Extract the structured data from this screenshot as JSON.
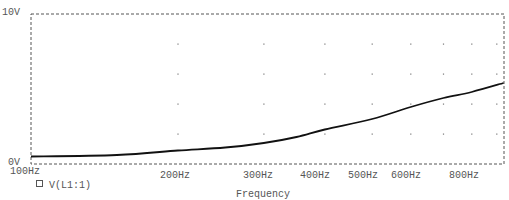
{
  "chart_data": {
    "type": "line",
    "title": "",
    "xlabel": "Frequency",
    "ylabel": "",
    "x_scale": "log",
    "xlim": [
      100,
      930
    ],
    "ylim": [
      0,
      10
    ],
    "y_tick_labels": [
      "0V",
      "10V"
    ],
    "x_tick_labels": [
      "100Hz",
      "200Hz",
      "300Hz",
      "400Hz",
      "500Hz",
      "600Hz",
      "800Hz"
    ],
    "grid": "dotted points at 2V steps and 100Hz decade steps",
    "legend": [
      {
        "marker": "square",
        "label": "V(L1:1)"
      }
    ],
    "series": [
      {
        "name": "V(L1:1)",
        "x": [
          100,
          150,
          200,
          250,
          300,
          350,
          400,
          500,
          600,
          700,
          800,
          930
        ],
        "y": [
          0.5,
          0.6,
          0.9,
          1.1,
          1.4,
          1.8,
          2.3,
          3.0,
          3.8,
          4.4,
          4.8,
          5.4
        ]
      }
    ]
  },
  "labels": {
    "y_top": "10V",
    "y_bottom": "0V",
    "x_axis_title": "Frequency",
    "legend_label": "V(L1:1)",
    "x_ticks": {
      "t100": "100Hz",
      "t200": "200Hz",
      "t300": "300Hz",
      "t400": "400Hz",
      "t500": "500Hz",
      "t600": "600Hz",
      "t800": "800Hz"
    }
  },
  "colors": {
    "trace": "#111111",
    "frame": "#555555",
    "grid_dot": "#777777"
  }
}
